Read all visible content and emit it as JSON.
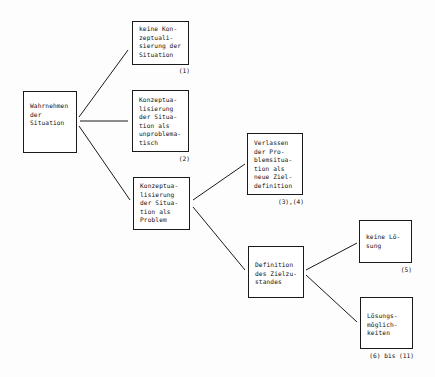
{
  "diagram": {
    "type": "decision-tree",
    "colors": {
      "line": "#1a1a1a",
      "box_border": "#1a1a1a",
      "text": "#111111",
      "background": "#ffffff"
    },
    "nodes": [
      {
        "id": "wahrnehmen",
        "lines": [
          "Wahrnehmen",
          "der",
          "Situation"
        ],
        "ref": ""
      },
      {
        "id": "keine-konzept",
        "lines": [
          "keine Kon-",
          "zeptuali-",
          "sierung der",
          "Situation"
        ],
        "ref": "(1)"
      },
      {
        "id": "unproblematisch",
        "lines": [
          "Konzeptua-",
          "lisierung",
          "der Situa-",
          "tion als",
          "unproblema-",
          "tisch"
        ],
        "ref": "(2)"
      },
      {
        "id": "problem",
        "lines": [
          "Konzeptua-",
          "lisierung",
          "der Situa-",
          "tion als",
          "Problem"
        ],
        "ref": ""
      },
      {
        "id": "verlassen",
        "lines": [
          "Verlassen",
          "der Pro-",
          "blemsitua-",
          "tion als",
          "neue Ziel-",
          "definition"
        ],
        "ref": "(3),(4)"
      },
      {
        "id": "definition",
        "lines": [
          "Definition",
          "des Zielzu-",
          "standes"
        ],
        "ref": ""
      },
      {
        "id": "keine-loesung",
        "lines": [
          "keine Lö-",
          "sung"
        ],
        "ref": "(5)"
      },
      {
        "id": "loesungsmoeglichkeiten",
        "lines": [
          "Lösungs-",
          "möglich-",
          "keiten"
        ],
        "ref": "(6) bis (11)"
      }
    ],
    "edges": [
      {
        "from": "wahrnehmen",
        "to": "keine-konzept"
      },
      {
        "from": "wahrnehmen",
        "to": "unproblematisch"
      },
      {
        "from": "wahrnehmen",
        "to": "problem"
      },
      {
        "from": "problem",
        "to": "verlassen"
      },
      {
        "from": "problem",
        "to": "definition"
      },
      {
        "from": "definition",
        "to": "keine-loesung"
      },
      {
        "from": "definition",
        "to": "loesungsmoeglichkeiten"
      }
    ]
  }
}
